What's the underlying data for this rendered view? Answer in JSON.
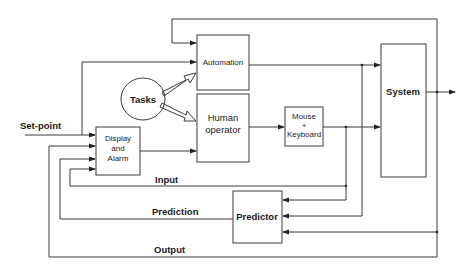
{
  "diagram": {
    "type": "block-diagram",
    "blocks": {
      "automation": "Automation",
      "human_operator_line1": "Human",
      "human_operator_line2": "operator",
      "mouse_keyboard_line1": "Mouse",
      "mouse_keyboard_line2": "+",
      "mouse_keyboard_line3": "Keyboard",
      "system": "System",
      "display_alarm_line1": "Display",
      "display_alarm_line2": "and",
      "display_alarm_line3": "Alarm",
      "predictor": "Predictor",
      "tasks": "Tasks"
    },
    "signals": {
      "setpoint": "Set-point",
      "input": "Input",
      "prediction": "Prediction",
      "output": "Output"
    },
    "colors": {
      "stroke": "#3a3a3a",
      "background": "#ffffff",
      "text": "#1a1a1a"
    }
  }
}
